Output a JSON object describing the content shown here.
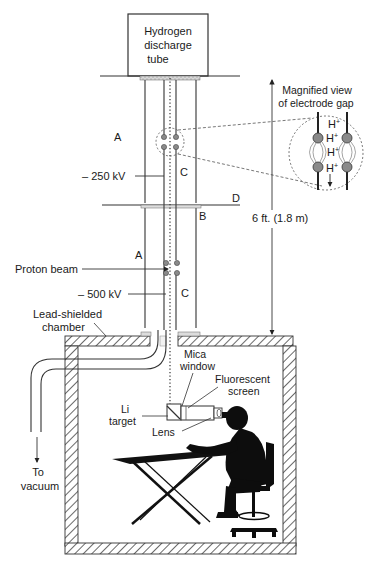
{
  "diagram": {
    "source_box": {
      "lines": [
        "Hydrogen",
        "discharge",
        "tube"
      ]
    },
    "column_labels": {
      "a_upper": "A",
      "c_upper": "C",
      "a_lower": "A",
      "c_lower": "C",
      "b": "B",
      "d": "D"
    },
    "voltages": {
      "upper": "– 250 kV",
      "lower": "– 500 kV"
    },
    "proton_beam": "Proton beam",
    "chamber": {
      "lines": [
        "Lead-shielded",
        "chamber"
      ]
    },
    "vacuum": {
      "lines": [
        "To",
        "vacuum"
      ]
    },
    "dimension": "6 ft. (1.8 m)",
    "magnified": {
      "title_lines": [
        "Magnified view",
        "of electrode gap"
      ],
      "ion": "H",
      "charge": "+"
    },
    "detector": {
      "mica": [
        "Mica",
        "window"
      ],
      "fluorescent": [
        "Fluorescent",
        "screen"
      ],
      "target": [
        "Li",
        "target"
      ],
      "lens": "Lens"
    },
    "colors": {
      "line": "#333333",
      "electrode": "#8a8a8a",
      "silhouette": "#0d0d0d",
      "hatch": "#444444",
      "background": "#ffffff"
    }
  }
}
